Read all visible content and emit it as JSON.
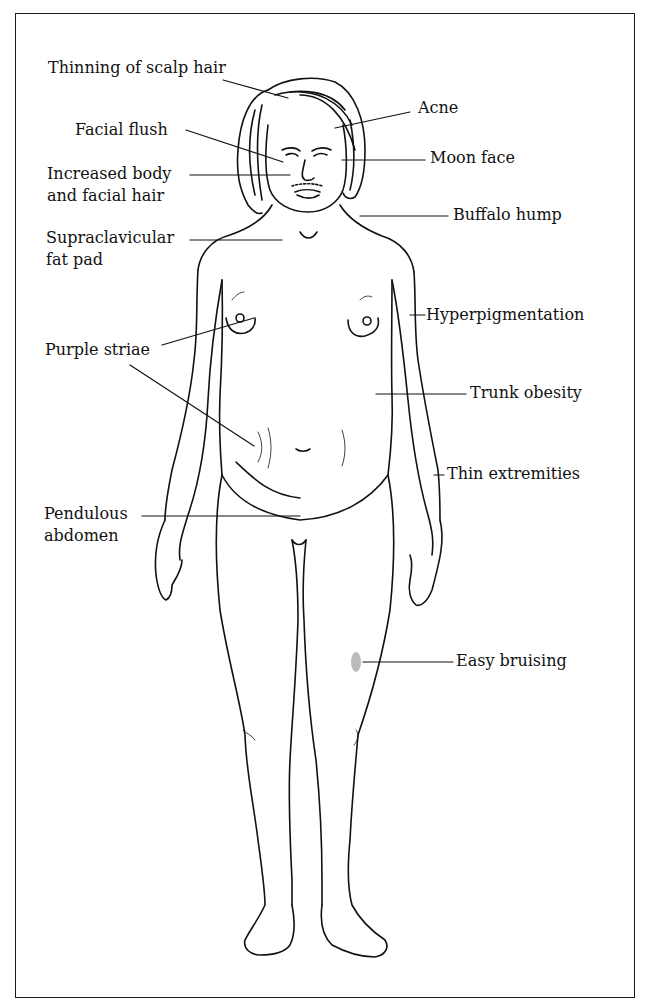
{
  "diagram": {
    "labels": {
      "thinning_hair": "Thinning of scalp hair",
      "acne": "Acne",
      "facial_flush": "Facial flush",
      "moon_face": "Moon face",
      "increased_hair_1": "Increased body",
      "increased_hair_2": "and facial hair",
      "buffalo_hump": "Buffalo hump",
      "supraclavicular_1": "Supraclavicular",
      "supraclavicular_2": "fat pad",
      "hyperpigmentation": "Hyperpigmentation",
      "purple_striae": "Purple striae",
      "trunk_obesity": "Trunk obesity",
      "thin_extremities": "Thin extremities",
      "pendulous_1": "Pendulous",
      "pendulous_2": "abdomen",
      "easy_bruising": "Easy bruising"
    }
  }
}
